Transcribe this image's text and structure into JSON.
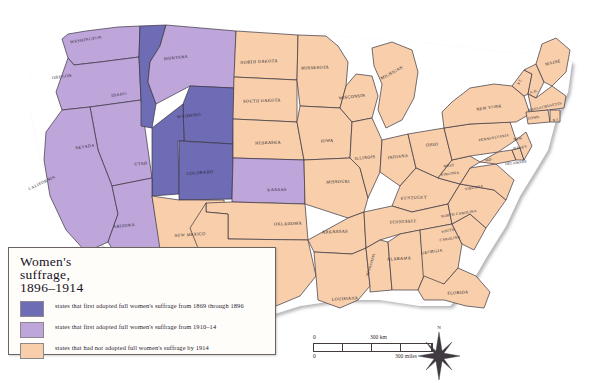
{
  "map": {
    "title": "Women's suffrage, 1896–1914",
    "colors": {
      "dark_purple": "#6e6cb4",
      "light_purple": "#bfa6da",
      "peach": "#f8cfaa",
      "border": "#3a3340",
      "background": "#ffffff"
    },
    "legend": {
      "title": "Women's\nsuffrage,\n1896–1914",
      "title_line1": "Women's",
      "title_line2": "suffrage,",
      "title_line3": "1896–1914",
      "items": [
        {
          "swatch": "#6e6cb4",
          "text": "states that first adopted full women's suffrage from 1869 through 1896"
        },
        {
          "swatch": "#bfa6da",
          "text": "states that first adopted full women's suffrage from 1910–14"
        },
        {
          "swatch": "#f8cfaa",
          "text": "states that had not adopted full women's suffrage by 1914"
        }
      ]
    },
    "scale": {
      "km_zero": "0",
      "km_label": "300 km",
      "mi_zero": "0",
      "mi_label": "300 miles"
    },
    "compass": {
      "north": "N"
    },
    "states": [
      {
        "id": "WA",
        "label": "WASHINGTON",
        "cat": "light",
        "x": 86,
        "y": 40,
        "rot": -9,
        "size": "sm"
      },
      {
        "id": "OR",
        "label": "OREGON",
        "cat": "light",
        "x": 62,
        "y": 77,
        "rot": -7,
        "size": "sm"
      },
      {
        "id": "CA",
        "label": "CALIFORNIA",
        "cat": "light",
        "x": 42,
        "y": 183,
        "rot": -26,
        "size": "sm"
      },
      {
        "id": "NV",
        "label": "NEVADA",
        "cat": "light",
        "x": 85,
        "y": 147,
        "rot": -9,
        "size": "sm"
      },
      {
        "id": "ID",
        "label": "IDAHO",
        "cat": "dark",
        "x": 119,
        "y": 95,
        "rot": -8,
        "size": "sm"
      },
      {
        "id": "MT",
        "label": "MONTANA",
        "cat": "light",
        "x": 176,
        "y": 58,
        "rot": -6,
        "size": "sm"
      },
      {
        "id": "WY",
        "label": "WYOMING",
        "cat": "dark",
        "x": 189,
        "y": 116,
        "rot": -6,
        "size": "sm"
      },
      {
        "id": "UT",
        "label": "UTAH",
        "cat": "dark",
        "x": 141,
        "y": 164,
        "rot": -5,
        "size": "sm"
      },
      {
        "id": "CO",
        "label": "COLORADO",
        "cat": "dark",
        "x": 200,
        "y": 173,
        "rot": -4,
        "size": "sm"
      },
      {
        "id": "AZ",
        "label": "ARIZONA",
        "cat": "light",
        "x": 124,
        "y": 226,
        "rot": -5,
        "size": "sm"
      },
      {
        "id": "NM",
        "label": "NEW MEXICO",
        "cat": "peach",
        "x": 190,
        "y": 235,
        "rot": -4,
        "size": "sm"
      },
      {
        "id": "ND",
        "label": "NORTH DAKOTA",
        "cat": "peach",
        "x": 259,
        "y": 62,
        "rot": -3,
        "size": "sm"
      },
      {
        "id": "SD",
        "label": "SOUTH DAKOTA",
        "cat": "peach",
        "x": 262,
        "y": 101,
        "rot": -2,
        "size": "sm"
      },
      {
        "id": "NE",
        "label": "NEBRASKA",
        "cat": "peach",
        "x": 268,
        "y": 143,
        "rot": -2,
        "size": "sm"
      },
      {
        "id": "KS",
        "label": "KANSAS",
        "cat": "light",
        "x": 277,
        "y": 190,
        "rot": -1,
        "size": "sm"
      },
      {
        "id": "OK",
        "label": "OKLAHOMA",
        "cat": "peach",
        "x": 288,
        "y": 224,
        "rot": -2,
        "size": "sm"
      },
      {
        "id": "TX",
        "label": "TEXAS",
        "cat": "peach",
        "x": 265,
        "y": 268,
        "rot": -2,
        "size": "sm"
      },
      {
        "id": "MN",
        "label": "MINNESOTA",
        "cat": "peach",
        "x": 315,
        "y": 68,
        "rot": -2,
        "size": "sm"
      },
      {
        "id": "IA",
        "label": "IOWA",
        "cat": "peach",
        "x": 327,
        "y": 141,
        "rot": -2,
        "size": "sm"
      },
      {
        "id": "MO",
        "label": "MISSOURI",
        "cat": "peach",
        "x": 338,
        "y": 182,
        "rot": -2,
        "size": "sm"
      },
      {
        "id": "AR",
        "label": "ARKANSAS",
        "cat": "peach",
        "x": 335,
        "y": 232,
        "rot": -2,
        "size": "sm"
      },
      {
        "id": "LA",
        "label": "LOUISIANA",
        "cat": "peach",
        "x": 345,
        "y": 299,
        "rot": -3,
        "size": "sm"
      },
      {
        "id": "WI",
        "label": "WISCONSIN",
        "cat": "peach",
        "x": 352,
        "y": 97,
        "rot": -6,
        "size": "sm"
      },
      {
        "id": "IL",
        "label": "ILLINOIS",
        "cat": "peach",
        "x": 365,
        "y": 158,
        "rot": -6,
        "size": "sm"
      },
      {
        "id": "MI",
        "label": "MICHIGAN",
        "cat": "peach",
        "x": 392,
        "y": 73,
        "rot": -28,
        "size": "sm"
      },
      {
        "id": "IN",
        "label": "INDIANA",
        "cat": "peach",
        "x": 398,
        "y": 157,
        "rot": -7,
        "size": "sm"
      },
      {
        "id": "OH",
        "label": "OHIO",
        "cat": "peach",
        "x": 432,
        "y": 145,
        "rot": -5,
        "size": "sm"
      },
      {
        "id": "KY",
        "label": "KENTUCKY",
        "cat": "peach",
        "x": 414,
        "y": 198,
        "rot": -3,
        "size": "sm"
      },
      {
        "id": "TN",
        "label": "TENNESSEE",
        "cat": "peach",
        "x": 403,
        "y": 222,
        "rot": -3,
        "size": "sm"
      },
      {
        "id": "MS",
        "label": "MISSISSIPPI",
        "cat": "peach",
        "x": 371,
        "y": 265,
        "rot": -72,
        "size": "xs"
      },
      {
        "id": "AL",
        "label": "ALABAMA",
        "cat": "peach",
        "x": 399,
        "y": 259,
        "rot": -3,
        "size": "sm"
      },
      {
        "id": "GA",
        "label": "GEORGIA",
        "cat": "peach",
        "x": 432,
        "y": 252,
        "rot": -8,
        "size": "sm"
      },
      {
        "id": "FL",
        "label": "FLORIDA",
        "cat": "peach",
        "x": 458,
        "y": 293,
        "rot": -3,
        "size": "sm"
      },
      {
        "id": "SC",
        "label": "SOUTH",
        "cat": "peach",
        "x": 448,
        "y": 231,
        "rot": -9,
        "size": "xs"
      },
      {
        "id": "SC2",
        "label": "CAROLINA",
        "cat": "peach",
        "x": 450,
        "y": 239,
        "rot": -9,
        "size": "xs"
      },
      {
        "id": "NC",
        "label": "NORTH CAROLINA",
        "cat": "peach",
        "x": 459,
        "y": 214,
        "rot": -9,
        "size": "xs"
      },
      {
        "id": "VA",
        "label": "VIRGINIA",
        "cat": "peach",
        "x": 474,
        "y": 188,
        "rot": -11,
        "size": "xs"
      },
      {
        "id": "WV",
        "label": "WEST",
        "cat": "peach",
        "x": 449,
        "y": 166,
        "rot": -8,
        "size": "xs"
      },
      {
        "id": "WV2",
        "label": "VIRGINIA",
        "cat": "peach",
        "x": 450,
        "y": 174,
        "rot": -8,
        "size": "xs"
      },
      {
        "id": "MD",
        "label": "MD.",
        "cat": "peach",
        "x": 489,
        "y": 160,
        "rot": -16,
        "size": "xs"
      },
      {
        "id": "DE",
        "label": "DELAWARE",
        "cat": "peach",
        "x": 516,
        "y": 163,
        "rot": -8,
        "size": "xs"
      },
      {
        "id": "PA",
        "label": "PENNSYLVANIA",
        "cat": "peach",
        "x": 494,
        "y": 138,
        "rot": -10,
        "size": "xs"
      },
      {
        "id": "NJ",
        "label": "NEW",
        "cat": "peach",
        "x": 518,
        "y": 139,
        "rot": -10,
        "size": "xs"
      },
      {
        "id": "NJ2",
        "label": "JERSEY",
        "cat": "peach",
        "x": 520,
        "y": 148,
        "rot": -10,
        "size": "xs"
      },
      {
        "id": "NY",
        "label": "NEW YORK",
        "cat": "peach",
        "x": 489,
        "y": 108,
        "rot": -8,
        "size": "sm"
      },
      {
        "id": "VT",
        "label": "VT.",
        "cat": "peach",
        "x": 520,
        "y": 82,
        "rot": -62,
        "size": "xs"
      },
      {
        "id": "NH",
        "label": "N.H.",
        "cat": "peach",
        "x": 534,
        "y": 92,
        "rot": -18,
        "size": "xs"
      },
      {
        "id": "MA",
        "label": "MASSACHUSETTS",
        "cat": "peach",
        "x": 545,
        "y": 107,
        "rot": -12,
        "size": "xs"
      },
      {
        "id": "CT",
        "label": "CONN.",
        "cat": "peach",
        "x": 534,
        "y": 118,
        "rot": -10,
        "size": "xs"
      },
      {
        "id": "RI",
        "label": "R.I.",
        "cat": "peach",
        "x": 556,
        "y": 120,
        "rot": -10,
        "size": "xs"
      },
      {
        "id": "ME",
        "label": "MAINE",
        "cat": "peach",
        "x": 553,
        "y": 63,
        "rot": -14,
        "size": "sm"
      }
    ]
  }
}
